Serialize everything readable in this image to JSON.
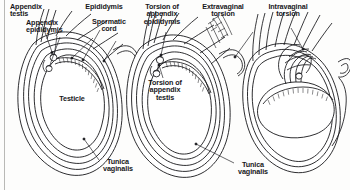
{
  "figure": {
    "background_color": "#fdfdfc",
    "ink_color": "#16161a",
    "border": {
      "present": true,
      "side": "left",
      "color": "#b9b9b6"
    }
  },
  "labels": {
    "appendix_testis": "Appendix\ntestis",
    "appendix_epididymis": "Appendix\nepididymis",
    "epididymis": "Epididymis",
    "spermatic_cord": "Spermatic\ncord",
    "torsion_appendix_epididymis": "Torsion of\nappendix\nepididymis",
    "extravaginal_torsion": "Extravaginal\ntorsion",
    "intravaginal_torsion": "Intravaginal\ntorsion",
    "testicle": "Testicle",
    "torsion_appendix_testis": "Torsion of\nappendix\ntestis",
    "tunica_vaginalis_left": "Tunica\nvaginalis",
    "tunica_vaginalis_right": "Tunica\nvaginalis"
  },
  "panels": [
    {
      "id": "panel-normal",
      "name": "normal-anatomy",
      "callouts": [
        "appendix_testis",
        "appendix_epididymis",
        "epididymis",
        "spermatic_cord",
        "testicle",
        "tunica_vaginalis_left"
      ]
    },
    {
      "id": "panel-appendage-torsion",
      "name": "appendage-torsion",
      "callouts": [
        "torsion_appendix_epididymis",
        "torsion_appendix_testis",
        "extravaginal_torsion",
        "tunica_vaginalis_right"
      ]
    },
    {
      "id": "panel-intravaginal-torsion",
      "name": "intravaginal-torsion",
      "callouts": [
        "intravaginal_torsion"
      ]
    }
  ]
}
